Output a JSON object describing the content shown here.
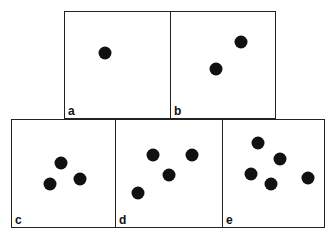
{
  "panels": [
    {
      "label": "a",
      "x": 64,
      "y": 11,
      "w": 107,
      "h": 108,
      "dots": [
        [
          104,
          52
        ]
      ]
    },
    {
      "label": "b",
      "x": 170,
      "y": 11,
      "w": 106,
      "h": 108,
      "dots": [
        [
          240,
          41
        ],
        [
          215,
          68
        ]
      ]
    },
    {
      "label": "c",
      "x": 11,
      "y": 119,
      "w": 105,
      "h": 109,
      "dots": [
        [
          60,
          162
        ],
        [
          49,
          183
        ],
        [
          79,
          178
        ]
      ]
    },
    {
      "label": "d",
      "x": 115,
      "y": 119,
      "w": 108,
      "h": 109,
      "dots": [
        [
          152,
          154
        ],
        [
          191,
          154
        ],
        [
          168,
          174
        ],
        [
          137,
          192
        ]
      ]
    },
    {
      "label": "e",
      "x": 222,
      "y": 119,
      "w": 103,
      "h": 109,
      "dots": [
        [
          257,
          142
        ],
        [
          279,
          158
        ],
        [
          250,
          173
        ],
        [
          270,
          183
        ],
        [
          307,
          177
        ]
      ]
    }
  ]
}
